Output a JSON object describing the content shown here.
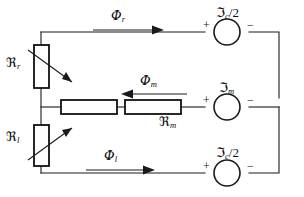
{
  "diagram": {
    "type": "magnetic-reluctance-circuit",
    "stroke_color": "#1a1a1a",
    "background_color": "#ffffff",
    "branches": [
      {
        "name": "top-branch",
        "flux_label_main": "Φ",
        "flux_label_sub": "r",
        "flux_direction": "right",
        "source_label_main": "ℑ",
        "source_label_sub": "c",
        "source_label_suffix": "/2",
        "polarity_left": "+",
        "polarity_right": "−"
      },
      {
        "name": "middle-branch",
        "flux_label_main": "Φ",
        "flux_label_sub": "m",
        "flux_direction": "left",
        "reluctance_label_main": "ℜ",
        "reluctance_label_sub": "m",
        "source_label_main": "ℑ",
        "source_label_sub": "m",
        "source_label_suffix": "",
        "polarity_left": "+",
        "polarity_right": "−"
      },
      {
        "name": "bottom-branch",
        "flux_label_main": "Φ",
        "flux_label_sub": "l",
        "flux_direction": "right",
        "source_label_main": "ℑ",
        "source_label_sub": "c",
        "source_label_suffix": "/2",
        "polarity_left": "+",
        "polarity_right": "−"
      }
    ],
    "variable_reluctances": [
      {
        "name": "upper-variable-reluctance",
        "label_main": "ℜ",
        "label_sub": "r",
        "arrow_direction": "down-right"
      },
      {
        "name": "lower-variable-reluctance",
        "label_main": "ℜ",
        "label_sub": "l",
        "arrow_direction": "up-right"
      }
    ]
  }
}
